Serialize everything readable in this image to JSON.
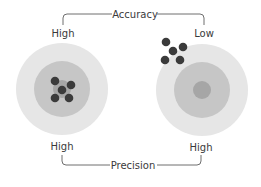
{
  "diagram": {
    "top_bracket": {
      "title": "Accuracy",
      "left_label": "High",
      "right_label": "Low"
    },
    "bottom_bracket": {
      "title": "Precision",
      "left_label": "High",
      "right_label": "High"
    },
    "targets": [
      {
        "name": "left-target",
        "accuracy": "High",
        "precision": "High"
      },
      {
        "name": "right-target",
        "accuracy": "Low",
        "precision": "High"
      }
    ],
    "colors": {
      "outer_ring": "#e6e6e6",
      "middle_ring": "#c6c6c6",
      "bullseye": "#a6a6a6",
      "dot": "#3b3b3b",
      "line": "#6e6e6e",
      "text": "#3a3a3a"
    }
  }
}
